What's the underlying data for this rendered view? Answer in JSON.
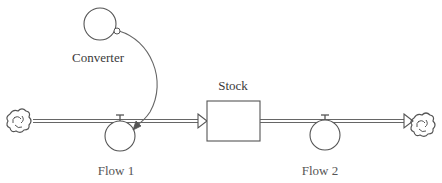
{
  "diagram": {
    "type": "stock-and-flow",
    "nodes": {
      "converter": {
        "label": "Converter",
        "kind": "converter"
      },
      "stock": {
        "label": "Stock",
        "kind": "stock"
      },
      "flow1": {
        "label": "Flow 1",
        "kind": "flow"
      },
      "flow2": {
        "label": "Flow 2",
        "kind": "flow"
      },
      "source_cloud": {
        "kind": "cloud"
      },
      "sink_cloud": {
        "kind": "cloud"
      }
    },
    "edges": [
      {
        "from": "source_cloud",
        "to": "stock",
        "via": "flow1",
        "kind": "flow-pipe"
      },
      {
        "from": "stock",
        "to": "sink_cloud",
        "via": "flow2",
        "kind": "flow-pipe"
      },
      {
        "from": "converter",
        "to": "flow1",
        "kind": "connector"
      }
    ],
    "colors": {
      "stroke": "#555555",
      "pipe": "#666666",
      "text": "#3a3a3a",
      "background": "#ffffff"
    }
  }
}
